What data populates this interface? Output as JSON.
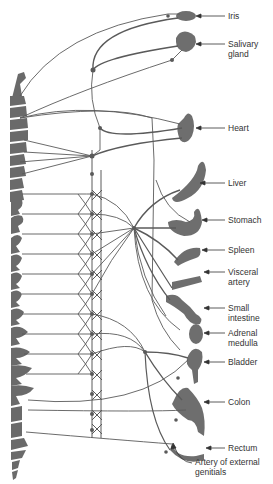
{
  "diagram": {
    "type": "autonomic-nervous-system-sympathetic-innervation",
    "colors": {
      "spine": "#6a6a6a",
      "organ": "#6e6e6e",
      "nerve": "#5a5a5a",
      "label": "#333333",
      "background": "#ffffff"
    },
    "organs": [
      {
        "id": "iris",
        "lines": [
          "Iris"
        ]
      },
      {
        "id": "salivary-gland",
        "lines": [
          "Salivary",
          "gland"
        ]
      },
      {
        "id": "heart",
        "lines": [
          "Heart"
        ]
      },
      {
        "id": "liver",
        "lines": [
          "Liver"
        ]
      },
      {
        "id": "stomach",
        "lines": [
          "Stomach"
        ]
      },
      {
        "id": "spleen",
        "lines": [
          "Spleen"
        ]
      },
      {
        "id": "visceral-artery",
        "lines": [
          "Visceral",
          "artery"
        ]
      },
      {
        "id": "small-intestine",
        "lines": [
          "Small",
          "intestine"
        ]
      },
      {
        "id": "adrenal-medulla",
        "lines": [
          "Adrenal",
          "medulla"
        ]
      },
      {
        "id": "bladder",
        "lines": [
          "Bladder"
        ]
      },
      {
        "id": "colon",
        "lines": [
          "Colon"
        ]
      },
      {
        "id": "rectum",
        "lines": [
          "Rectum"
        ]
      },
      {
        "id": "artery-of-external-genitials",
        "lines": [
          "Artery of external",
          "genitials"
        ]
      }
    ]
  }
}
